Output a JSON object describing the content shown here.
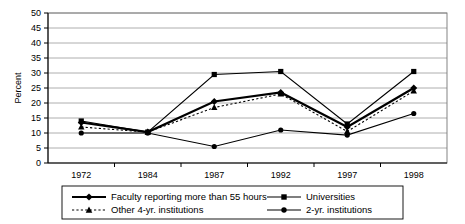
{
  "chart_data": {
    "type": "line",
    "title": "",
    "xlabel": "",
    "ylabel": "Percent",
    "categories": [
      "1972",
      "1984",
      "1987",
      "1992",
      "1997",
      "1998"
    ],
    "ylim": [
      0,
      50
    ],
    "ytick_step": 5,
    "yticks": [
      "0",
      "5",
      "10",
      "15",
      "20",
      "25",
      "30",
      "35",
      "40",
      "45",
      "50"
    ],
    "grid": "horizontal",
    "legend_position": "bottom",
    "series": [
      {
        "name": "Faculty reporting more than 55 hours",
        "marker": "diamond",
        "line_style": "solid",
        "line_weight": "thick",
        "color": "#000000",
        "values": [
          13.5,
          10.3,
          20.5,
          23.5,
          12.0,
          25.0
        ]
      },
      {
        "name": "Universities",
        "marker": "square",
        "line_style": "solid",
        "line_weight": "thin",
        "color": "#000000",
        "values": [
          14.0,
          10.3,
          29.5,
          30.5,
          13.0,
          30.5
        ]
      },
      {
        "name": "Other 4-yr. institutions",
        "marker": "triangle",
        "line_style": "dotted",
        "line_weight": "thin",
        "color": "#000000",
        "values": [
          12.0,
          10.3,
          18.5,
          23.0,
          10.5,
          24.0
        ]
      },
      {
        "name": "2-yr. institutions",
        "marker": "circle",
        "line_style": "solid",
        "line_weight": "thin",
        "color": "#000000",
        "values": [
          10.0,
          10.0,
          5.5,
          11.0,
          9.3,
          16.5
        ]
      }
    ]
  },
  "axis": {
    "y_title": "Percent"
  },
  "legend": {
    "entries": [
      {
        "label": "Faculty reporting more than 55 hours"
      },
      {
        "label": "Universities"
      },
      {
        "label": "Other 4-yr. institutions"
      },
      {
        "label": "2-yr. institutions"
      }
    ]
  }
}
